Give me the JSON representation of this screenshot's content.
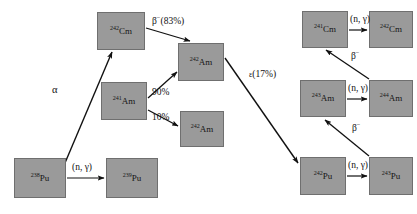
{
  "diagram": {
    "box_fill": "#9a9a9a",
    "box_stroke": "#6f6f6f",
    "arrow_color": "#111111",
    "background": "#ffffff",
    "nuclides": [
      {
        "id": "pu238",
        "mass": "238",
        "element": "Pu",
        "x": 14,
        "y": 158,
        "w": 52,
        "h": 40
      },
      {
        "id": "pu239",
        "mass": "239",
        "element": "Pu",
        "x": 106,
        "y": 158,
        "w": 52,
        "h": 40
      },
      {
        "id": "cm242",
        "mass": "242",
        "element": "Cm",
        "x": 97,
        "y": 12,
        "w": 48,
        "h": 38
      },
      {
        "id": "am241",
        "mass": "241",
        "element": "Am",
        "x": 101,
        "y": 82,
        "w": 46,
        "h": 38
      },
      {
        "id": "am242",
        "mass": "242",
        "element": "Am",
        "x": 178,
        "y": 43,
        "w": 46,
        "h": 38
      },
      {
        "id": "am242m",
        "mass": "242",
        "element": "Am",
        "x": 180,
        "y": 111,
        "w": 44,
        "h": 36
      },
      {
        "id": "cm241",
        "mass": "241",
        "element": "Cm",
        "x": 302,
        "y": 11,
        "w": 46,
        "h": 37
      },
      {
        "id": "cm242r",
        "mass": "242",
        "element": "Cm",
        "x": 369,
        "y": 11,
        "w": 44,
        "h": 37
      },
      {
        "id": "am243",
        "mass": "243",
        "element": "Am",
        "x": 300,
        "y": 80,
        "w": 46,
        "h": 37
      },
      {
        "id": "am244",
        "mass": "244",
        "element": "Am",
        "x": 369,
        "y": 80,
        "w": 44,
        "h": 37
      },
      {
        "id": "pu242",
        "mass": "242",
        "element": "Pu",
        "x": 300,
        "y": 157,
        "w": 46,
        "h": 38
      },
      {
        "id": "pu243",
        "mass": "243",
        "element": "Pu",
        "x": 369,
        "y": 157,
        "w": 44,
        "h": 38
      }
    ],
    "edges": [
      {
        "id": "pu238-pu239",
        "label": "(n, γ)",
        "type": "neutron-capture"
      },
      {
        "id": "pu239-cm242",
        "label": "α",
        "type": "alpha-decay"
      },
      {
        "id": "cm242-am242",
        "label": "β⁻(83%)",
        "type": "beta-decay"
      },
      {
        "id": "am241-am242",
        "label": "90%",
        "type": "branch"
      },
      {
        "id": "am241-am242m",
        "label": "10%",
        "type": "branch"
      },
      {
        "id": "am242-pu242",
        "label": "ε(17%)",
        "type": "electron-capture"
      },
      {
        "id": "cm241-cm242r",
        "label": "(n, γ)",
        "type": "neutron-capture"
      },
      {
        "id": "am243-am244",
        "label": "(n, γ)",
        "type": "neutron-capture"
      },
      {
        "id": "pu242-pu243",
        "label": "(n, γ)",
        "type": "neutron-capture"
      },
      {
        "id": "am243-cm241",
        "label": "β⁻",
        "type": "beta-decay"
      },
      {
        "id": "pu243-am243",
        "label": "β⁻",
        "type": "beta-decay"
      }
    ],
    "labels": {
      "alpha": "α",
      "beta_83": "β",
      "beta_83_sup": "−",
      "beta_83_pct": "(83%)",
      "branch_90": "90%",
      "branch_10": "10%",
      "epsilon_glyph": "ε",
      "epsilon_pct": "(17%)",
      "n_gamma": "(n, γ)",
      "beta_minus": "β",
      "beta_minus_sup": "−"
    }
  }
}
